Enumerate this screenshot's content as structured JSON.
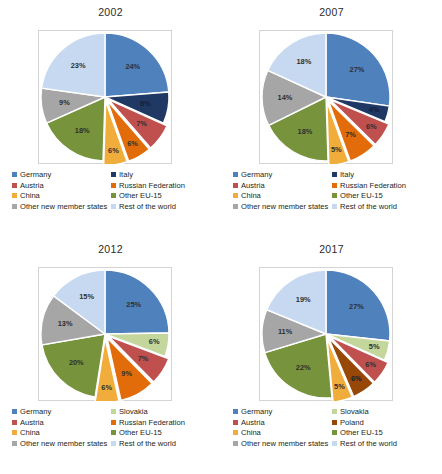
{
  "colors": {
    "germany": "#4f81bd",
    "italy": "#1f3864",
    "austria": "#c0504d",
    "russian_federation": "#e36c0a",
    "china": "#f0ad3c",
    "other_eu15": "#77933c",
    "other_new_member_states": "#a6a6a6",
    "rest_of_the_world": "#c6d9f0",
    "slovakia": "#c3d69b",
    "poland": "#974706"
  },
  "panels": [
    {
      "id": "panel-2002",
      "title": "2002",
      "chart_data": {
        "type": "pie",
        "title": "2002",
        "legend_position": "bottom",
        "categories": [
          "Germany",
          "Italy",
          "Austria",
          "Russian Federation",
          "China",
          "Other EU-15",
          "Other new member states",
          "Rest of the world"
        ],
        "values": [
          24,
          8,
          7,
          6,
          6,
          18,
          9,
          23
        ],
        "labels": [
          "24%",
          "8%",
          "7%",
          "6%",
          "6%",
          "18%",
          "9%",
          "23%"
        ],
        "colors": [
          "#4f81bd",
          "#1f3864",
          "#c0504d",
          "#e36c0a",
          "#f0ad3c",
          "#77933c",
          "#a6a6a6",
          "#c6d9f0"
        ],
        "exploded": [
          false,
          false,
          true,
          true,
          true,
          false,
          false,
          false
        ]
      },
      "legend": [
        {
          "label": "Germany",
          "color": "#4f81bd"
        },
        {
          "label": "Italy",
          "color": "#1f3864"
        },
        {
          "label": "Austria",
          "color": "#c0504d"
        },
        {
          "label": "Russian Federation",
          "color": "#e36c0a"
        },
        {
          "label": "China",
          "color": "#f0ad3c"
        },
        {
          "label": "Other EU-15",
          "color": "#77933c"
        },
        {
          "label": "Other new member states",
          "color": "#a6a6a6"
        },
        {
          "label": "Rest of the world",
          "color": "#c6d9f0"
        }
      ]
    },
    {
      "id": "panel-2007",
      "title": "2007",
      "chart_data": {
        "type": "pie",
        "title": "2007",
        "legend_position": "bottom",
        "categories": [
          "Germany",
          "Italy",
          "Austria",
          "Russian Federation",
          "China",
          "Other EU-15",
          "Other new member states",
          "Rest of the world"
        ],
        "values": [
          27,
          4,
          6,
          7,
          5,
          18,
          14,
          18
        ],
        "labels": [
          "27%",
          "4%",
          "6%",
          "7%",
          "5%",
          "18%",
          "14%",
          "18%"
        ],
        "colors": [
          "#4f81bd",
          "#1f3864",
          "#c0504d",
          "#e36c0a",
          "#f0ad3c",
          "#77933c",
          "#a6a6a6",
          "#c6d9f0"
        ],
        "exploded": [
          false,
          false,
          true,
          true,
          true,
          false,
          false,
          false
        ]
      },
      "legend": [
        {
          "label": "Germany",
          "color": "#4f81bd"
        },
        {
          "label": "Italy",
          "color": "#1f3864"
        },
        {
          "label": "Austria",
          "color": "#c0504d"
        },
        {
          "label": "Russian Federation",
          "color": "#e36c0a"
        },
        {
          "label": "China",
          "color": "#f0ad3c"
        },
        {
          "label": "Other EU-15",
          "color": "#77933c"
        },
        {
          "label": "Other new member states",
          "color": "#a6a6a6"
        },
        {
          "label": "Rest of the world",
          "color": "#c6d9f0"
        }
      ]
    },
    {
      "id": "panel-2012",
      "title": "2012",
      "chart_data": {
        "type": "pie",
        "title": "2012",
        "legend_position": "bottom",
        "categories": [
          "Germany",
          "Slovakia",
          "Austria",
          "Russian Federation",
          "China",
          "Other EU-15",
          "Other new member states",
          "Rest of the world"
        ],
        "values": [
          25,
          6,
          7,
          9,
          6,
          20,
          13,
          15
        ],
        "labels": [
          "25%",
          "6%",
          "7%",
          "9%",
          "6%",
          "20%",
          "13%",
          "15%"
        ],
        "colors": [
          "#4f81bd",
          "#c3d69b",
          "#c0504d",
          "#e36c0a",
          "#f0ad3c",
          "#77933c",
          "#a6a6a6",
          "#c6d9f0"
        ],
        "exploded": [
          false,
          false,
          true,
          true,
          true,
          false,
          false,
          false
        ]
      },
      "legend": [
        {
          "label": "Germany",
          "color": "#4f81bd"
        },
        {
          "label": "Slovakia",
          "color": "#c3d69b"
        },
        {
          "label": "Austria",
          "color": "#c0504d"
        },
        {
          "label": "Russian Federation",
          "color": "#e36c0a"
        },
        {
          "label": "China",
          "color": "#f0ad3c"
        },
        {
          "label": "Other EU-15",
          "color": "#77933c"
        },
        {
          "label": "Other new member states",
          "color": "#a6a6a6"
        },
        {
          "label": "Rest of the world",
          "color": "#c6d9f0"
        }
      ]
    },
    {
      "id": "panel-2017",
      "title": "2017",
      "chart_data": {
        "type": "pie",
        "title": "2017",
        "legend_position": "bottom",
        "categories": [
          "Germany",
          "Slovakia",
          "Austria",
          "Poland",
          "China",
          "Other EU-15",
          "Other new member states",
          "Rest of the world"
        ],
        "values": [
          27,
          5,
          6,
          6,
          5,
          22,
          11,
          19
        ],
        "labels": [
          "27%",
          "5%",
          "6%",
          "6%",
          "5%",
          "22%",
          "11%",
          "19%"
        ],
        "colors": [
          "#4f81bd",
          "#c3d69b",
          "#c0504d",
          "#974706",
          "#f0ad3c",
          "#77933c",
          "#a6a6a6",
          "#c6d9f0"
        ],
        "exploded": [
          false,
          false,
          true,
          true,
          true,
          false,
          false,
          false
        ]
      },
      "legend": [
        {
          "label": "Germany",
          "color": "#4f81bd"
        },
        {
          "label": "Slovakia",
          "color": "#c3d69b"
        },
        {
          "label": "Austria",
          "color": "#c0504d"
        },
        {
          "label": "Poland",
          "color": "#974706"
        },
        {
          "label": "China",
          "color": "#f0ad3c"
        },
        {
          "label": "Other EU-15",
          "color": "#77933c"
        },
        {
          "label": "Other new member states",
          "color": "#a6a6a6"
        },
        {
          "label": "Rest of the world",
          "color": "#c6d9f0"
        }
      ]
    }
  ]
}
